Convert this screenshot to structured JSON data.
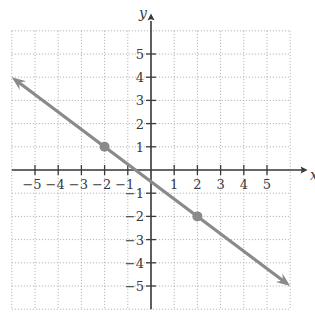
{
  "chart_data": {
    "type": "line",
    "title": "",
    "xlabel": "x",
    "ylabel": "y",
    "xlim": [
      -6,
      6
    ],
    "ylim": [
      -6,
      6
    ],
    "grid": true,
    "x_ticks": [
      -5,
      -4,
      -3,
      -2,
      -1,
      1,
      2,
      3,
      4,
      5
    ],
    "y_ticks": [
      -5,
      -4,
      -3,
      -2,
      -1,
      1,
      2,
      3,
      4,
      5
    ],
    "x_tick_labels": [
      "−5",
      "−4",
      "−3",
      "−2",
      "−1",
      "1",
      "2",
      "3",
      "4",
      "5"
    ],
    "y_tick_labels": [
      "−5",
      "−4",
      "−3",
      "−2",
      "−1",
      "1",
      "2",
      "3",
      "4",
      "5"
    ],
    "series": [
      {
        "name": "line",
        "equation": "y = -3/4 x - 1/2",
        "slope": -0.75,
        "intercept": -0.5,
        "arrows": "both ends",
        "x": [
          -6,
          6
        ],
        "y": [
          4,
          -5
        ]
      }
    ],
    "points": [
      {
        "x": -2,
        "y": 1
      },
      {
        "x": 2,
        "y": -2
      }
    ]
  },
  "colors": {
    "line": "#8a8a8a",
    "point": "#8a8a8a",
    "axis": "#3a3a3a",
    "grid": "#b8b8b8"
  }
}
